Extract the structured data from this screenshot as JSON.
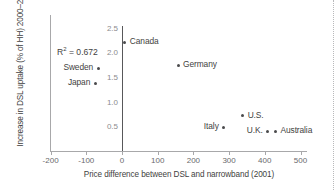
{
  "chart_data": {
    "type": "scatter",
    "title": "",
    "xlabel": "Price difference between DSL and narrowband (2001)",
    "ylabel": "Increase in DSL uptake (% of HH) 2000–2002",
    "xlim": [
      -200,
      500
    ],
    "ylim": [
      0,
      2.7
    ],
    "xticks": [
      -200,
      -100,
      0,
      100,
      200,
      300,
      400,
      500
    ],
    "xtick_labels": [
      "-200",
      "-100",
      "0",
      "100",
      "200",
      "300",
      "400",
      "500"
    ],
    "yticks": [
      0.5,
      1.0,
      1.5,
      2.0,
      2.5
    ],
    "ytick_labels": [
      "0.5",
      "1.0",
      "1.5",
      "2.0",
      "2.5"
    ],
    "grid": false,
    "legend": "none",
    "annotation": "R² = 0.672",
    "annotation_value": 0.672,
    "points": [
      {
        "label": "Canada",
        "x": 8,
        "y": 2.22,
        "label_side": "right"
      },
      {
        "label": "Germany",
        "x": 157,
        "y": 1.76,
        "label_side": "right"
      },
      {
        "label": "Sweden",
        "x": -67,
        "y": 1.7,
        "label_side": "left"
      },
      {
        "label": "Japan",
        "x": -75,
        "y": 1.39,
        "label_side": "left"
      },
      {
        "label": "U.S.",
        "x": 338,
        "y": 0.73,
        "label_side": "right"
      },
      {
        "label": "Italy",
        "x": 285,
        "y": 0.5,
        "label_side": "left"
      },
      {
        "label": "U.K.",
        "x": 408,
        "y": 0.42,
        "label_side": "left"
      },
      {
        "label": "Australia",
        "x": 430,
        "y": 0.42,
        "label_side": "right"
      }
    ]
  },
  "axes": {
    "y_title": "Increase in DSL uptake (% of HH) 2000–2002",
    "x_title": "Price difference between DSL and narrowband (2001)"
  },
  "annotation": {
    "r2_prefix": "R",
    "r2_exponent": "2",
    "r2_value": " = 0.672"
  },
  "colors": {
    "marker": "#4a4a4c",
    "text": "#3f3f41",
    "axis": "#a8a8aa",
    "zero_axis": "#58585a",
    "tick_text": "#8c8c8e",
    "background": "#ffffff"
  }
}
